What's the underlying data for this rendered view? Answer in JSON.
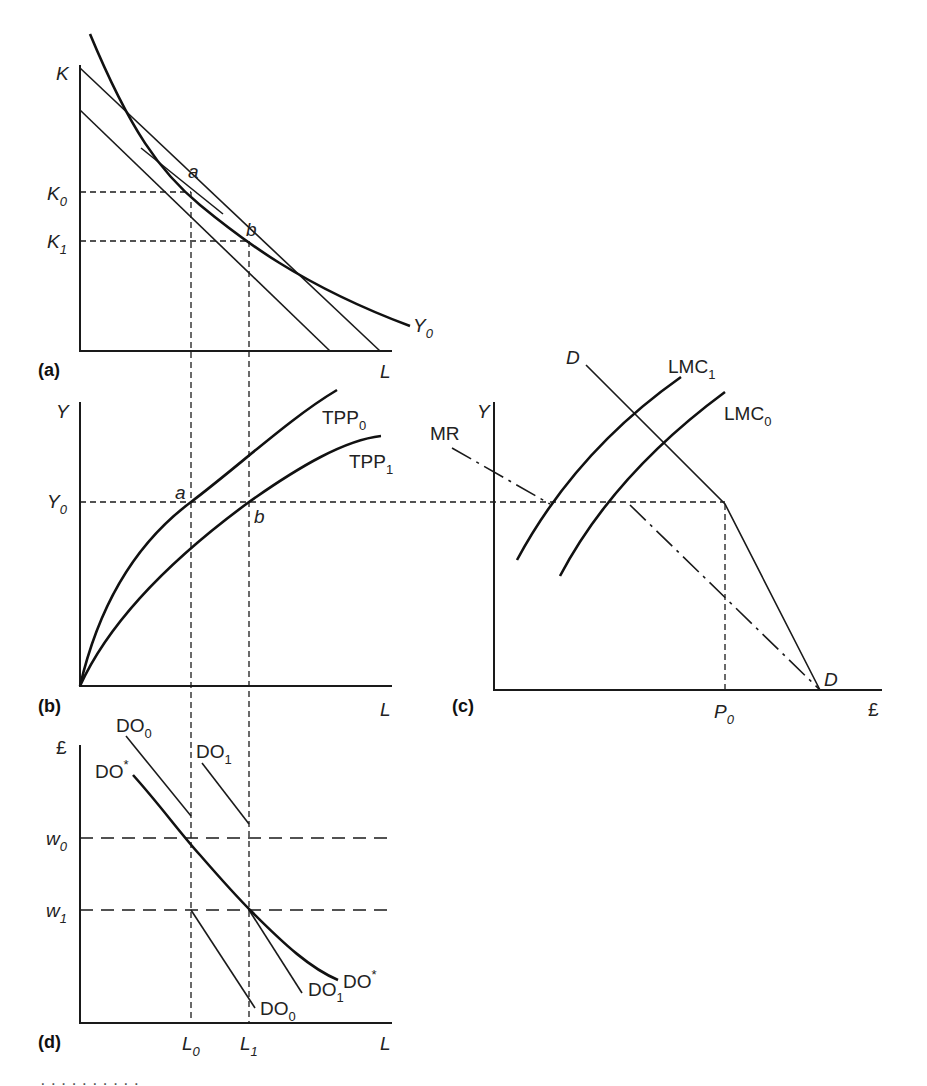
{
  "figure": {
    "panels": {
      "a": {
        "tag": "(a)",
        "y_axis": "K",
        "x_axis": "L",
        "y_ticks": [
          {
            "main": "K",
            "sub": "0"
          },
          {
            "main": "K",
            "sub": "1"
          }
        ],
        "points": [
          "a",
          "b"
        ],
        "curve_label": {
          "main": "Y",
          "sub": "0"
        }
      },
      "b": {
        "tag": "(b)",
        "y_axis": "Y",
        "x_axis": "L",
        "y_tick": {
          "main": "Y",
          "sub": "0"
        },
        "points": [
          "a",
          "b"
        ],
        "curves": [
          {
            "main": "TPP",
            "sub": "0"
          },
          {
            "main": "TPP",
            "sub": "1"
          }
        ]
      },
      "c": {
        "tag": "(c)",
        "y_axis": "Y",
        "x_axis": "£",
        "x_tick": {
          "main": "P",
          "sub": "0"
        },
        "demand_top": "D",
        "demand_bottom": "D",
        "mr": "MR",
        "curves": [
          {
            "main": "LMC",
            "sub": "1"
          },
          {
            "main": "LMC",
            "sub": "0"
          }
        ]
      },
      "d": {
        "tag": "(d)",
        "y_axis": "£",
        "x_axis": "L",
        "y_ticks": [
          {
            "main": "w",
            "sub": "0"
          },
          {
            "main": "w",
            "sub": "1"
          }
        ],
        "x_ticks": [
          {
            "main": "L",
            "sub": "0"
          },
          {
            "main": "L",
            "sub": "1"
          }
        ],
        "curves_top": [
          {
            "main": "DO",
            "sub": "0"
          },
          {
            "main": "DO",
            "sub": "1"
          },
          {
            "main": "DO",
            "sup": "*"
          }
        ],
        "curves_bottom": [
          {
            "main": "DO",
            "sub": "0"
          },
          {
            "main": "DO",
            "sub": "1"
          },
          {
            "main": "DO",
            "sup": "*"
          }
        ]
      }
    },
    "caption_clipped": "· · · · · · · · · ·"
  }
}
